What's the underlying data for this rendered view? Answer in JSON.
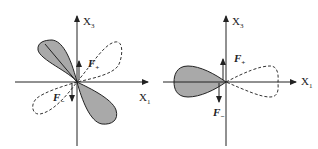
{
  "diagrams": [
    {
      "id": "left",
      "axis_x_label": "X",
      "axis_x_sub": "1",
      "axis_y_label": "X",
      "axis_y_sub": "3",
      "force_plus_label": "F",
      "force_plus_sub": "+",
      "force_minus_label": "F",
      "force_minus_sub": "−",
      "solid_lobes": "two shaded lobes along upper-left / lower-right diagonal",
      "dashed_lobes": "two dashed lobes along upper-right / lower-left diagonal"
    },
    {
      "id": "right",
      "axis_x_label": "X",
      "axis_x_sub": "1",
      "axis_y_label": "X",
      "axis_y_sub": "3",
      "force_plus_label": "F",
      "force_plus_sub": "+",
      "force_minus_label": "F",
      "force_minus_sub": "−",
      "solid_lobes": "one shaded lobe pointing left along X1",
      "dashed_lobes": "one dashed lobe pointing right along X1"
    }
  ],
  "colors": {
    "fill": "#a9a9a9",
    "stroke": "#222222"
  }
}
